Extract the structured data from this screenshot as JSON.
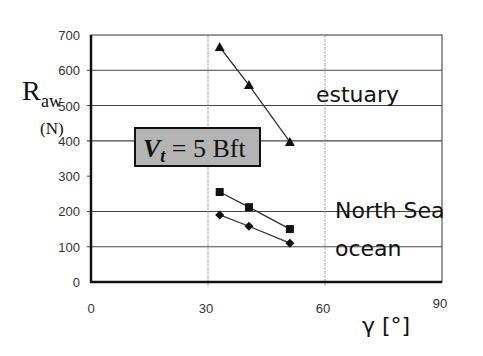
{
  "chart_data": {
    "type": "line",
    "title": "",
    "annotation": {
      "var": "V",
      "sub": "t",
      "text": "= 5 Bft"
    },
    "xlabel": "γ [°]",
    "ylabel": "R",
    "ylabel_sub": "aw",
    "yunit": "(N)",
    "xlim": [
      0,
      90
    ],
    "ylim": [
      0,
      700
    ],
    "xticks": [
      "0",
      "30",
      "60",
      "90"
    ],
    "yticks": [
      "0",
      "100",
      "200",
      "300",
      "400",
      "500",
      "600",
      "700"
    ],
    "grid": true,
    "series": [
      {
        "name": "estuary",
        "marker": "triangle",
        "x": [
          33,
          40.5,
          51
        ],
        "values": [
          666,
          558,
          397
        ]
      },
      {
        "name": "North Sea",
        "marker": "square",
        "x": [
          33,
          40.5,
          51
        ],
        "values": [
          255,
          212,
          150
        ]
      },
      {
        "name": "ocean",
        "marker": "diamond",
        "x": [
          33,
          40.5,
          51
        ],
        "values": [
          190,
          158,
          110
        ]
      }
    ],
    "legend_position": "inline-right"
  }
}
